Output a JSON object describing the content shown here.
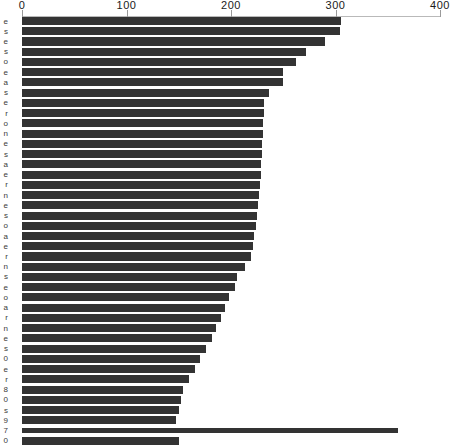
{
  "chart_data": {
    "type": "bar",
    "orientation": "horizontal",
    "title": "",
    "subtitle": "",
    "xlabel": "",
    "ylabel": "",
    "xlim": [
      0,
      400
    ],
    "ylim": null,
    "grid": false,
    "legend": null,
    "legend_position": "none",
    "axis_position": "top",
    "bar_color": "#333333",
    "axis_color": "#b9b9b9",
    "background": "#ffffff",
    "xticks": [
      0,
      100,
      200,
      300,
      400
    ],
    "xtick_labels": [
      "0",
      "100",
      "200",
      "300",
      "400"
    ],
    "ytick_labels_visible": false,
    "ytick_labels_note": "y-axis category labels are clipped off the left edge of the screenshot; only a 1-2 pixel sliver of each label is rendered",
    "categories": [
      "cat-01",
      "cat-02",
      "cat-03",
      "cat-04",
      "cat-05",
      "cat-06",
      "cat-07",
      "cat-08",
      "cat-09",
      "cat-10",
      "cat-11",
      "cat-12",
      "cat-13",
      "cat-14",
      "cat-15",
      "cat-16",
      "cat-17",
      "cat-18",
      "cat-19",
      "cat-20",
      "cat-21",
      "cat-22",
      "cat-23",
      "cat-24",
      "cat-25",
      "cat-26",
      "cat-27",
      "cat-28",
      "cat-29",
      "cat-30",
      "cat-31",
      "cat-32",
      "cat-33",
      "cat-34",
      "cat-35",
      "cat-36",
      "cat-37",
      "cat-38",
      "cat-39",
      "cat-40",
      "cat-41",
      "cat-42"
    ],
    "values": [
      305,
      304,
      290,
      272,
      262,
      250,
      250,
      236,
      232,
      232,
      231,
      231,
      230,
      230,
      229,
      229,
      228,
      227,
      226,
      225,
      224,
      222,
      221,
      219,
      213,
      206,
      204,
      198,
      194,
      190,
      186,
      182,
      176,
      170,
      166,
      160,
      154,
      152,
      150,
      147,
      360,
      150
    ],
    "ystubs": [
      "e",
      "s",
      "e",
      "s",
      "o",
      "e",
      "a",
      "s",
      "e",
      "r",
      "o",
      "n",
      "e",
      "s",
      "a",
      "e",
      "r",
      "n",
      "e",
      "s",
      "o",
      "a",
      "e",
      "r",
      "n",
      "s",
      "e",
      "o",
      "a",
      "r",
      "n",
      "e",
      "s",
      "0",
      "e",
      "r",
      "8",
      "0",
      "s",
      "9",
      "7",
      "0"
    ],
    "notable": {
      "max_value": 360,
      "max_value_row_index": 40,
      "max_value_note": "an unusually long thin bar near the bottom extends to approximately 360, well past every other bar",
      "min_value": 147,
      "first_value": 305,
      "bar_count": 42
    }
  },
  "axis": {
    "tick_px": {
      "0": 22,
      "100": 127,
      "200": 232,
      "300": 337,
      "400": 440
    }
  }
}
